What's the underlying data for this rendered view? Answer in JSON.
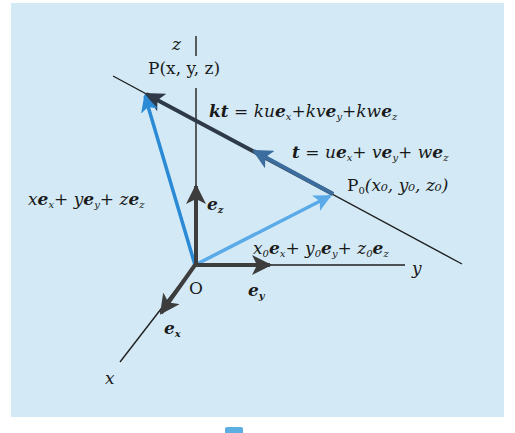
{
  "figure": {
    "background_color": "#d3eaf6",
    "colors": {
      "axis": "#1f1f1f",
      "basis_vector": "#3d3d3d",
      "kt_vector": "#2e3a48",
      "t_vector": "#3b6d9e",
      "op_vector": "#2a8ad6",
      "op0_vector": "#5aa9e8",
      "marker": "#5aaee0"
    },
    "axes": {
      "x_label": "x",
      "y_label": "y",
      "z_label": "z",
      "origin_label": "O"
    },
    "basis": {
      "ex": "e",
      "ex_sub": "x",
      "ey": "e",
      "ey_sub": "y",
      "ez": "e",
      "ez_sub": "z"
    },
    "points": {
      "P": "P(x, y, z)",
      "P0_main": "P",
      "P0_sub": "0",
      "P0_coords": "(x₀, y₀, z₀)"
    },
    "equations": {
      "kt_lhs": "kt",
      "kt_eq": "=",
      "kt_rhs": "kue_x + kve_y + kwe_z",
      "t_lhs": "t",
      "t_eq": "=",
      "t_rhs": "ue_x + ve_y + we_z",
      "op": "xe_x + ye_y + ze_z",
      "op0": "x₀e_x + y₀e_y + z₀e_z"
    }
  }
}
